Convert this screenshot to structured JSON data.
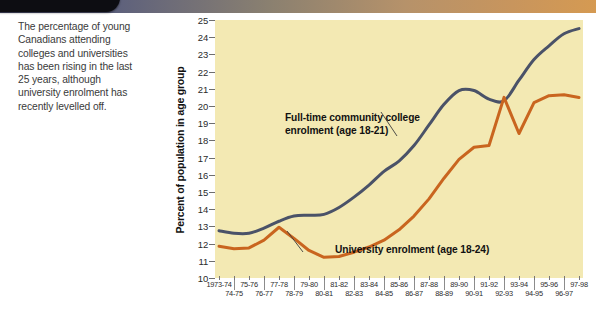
{
  "caption": {
    "text": "The percentage of young Canadians attending colleges and universities has been rising in the last 25 years, although university enrolment has recently levelled off."
  },
  "chart_data": {
    "type": "line",
    "title": "",
    "xlabel": "",
    "ylabel": "Percent of population in age group",
    "ylim": [
      10,
      25
    ],
    "yticks": [
      10,
      11,
      12,
      13,
      14,
      15,
      16,
      17,
      18,
      19,
      20,
      21,
      22,
      23,
      24,
      25
    ],
    "grid": false,
    "legend_position": "inline-annotation",
    "categories": [
      "1973-74",
      "74-75",
      "75-76",
      "76-77",
      "77-78",
      "78-79",
      "79-80",
      "80-81",
      "81-82",
      "82-83",
      "83-84",
      "84-85",
      "85-86",
      "86-87",
      "87-88",
      "88-89",
      "89-90",
      "90-91",
      "91-92",
      "92-93",
      "93-94",
      "94-95",
      "95-96",
      "96-97",
      "97-98"
    ],
    "xtick_labels_top": [
      "1973-74",
      "75-76",
      "77-78",
      "79-80",
      "81-82",
      "83-84",
      "85-86",
      "87-88",
      "89-90",
      "91-92",
      "93-94",
      "95-96",
      "97-98"
    ],
    "xtick_labels_bottom": [
      "74-75",
      "76-77",
      "78-79",
      "80-81",
      "82-83",
      "84-85",
      "86-87",
      "88-89",
      "90-91",
      "92-93",
      "94-95",
      "96-97"
    ],
    "series": [
      {
        "name": "Full-time community college enrolment (age 18-21)",
        "color": "#4a5268",
        "values": [
          12.75,
          12.6,
          12.6,
          12.9,
          13.3,
          13.6,
          13.65,
          13.7,
          14.1,
          14.7,
          15.4,
          16.2,
          16.8,
          17.7,
          18.9,
          20.1,
          20.9,
          20.9,
          20.4,
          20.3,
          21.5,
          22.7,
          23.5,
          24.2,
          24.5
        ]
      },
      {
        "name": "University enrolment (age 18-24)",
        "color": "#c9651f",
        "values": [
          11.85,
          11.7,
          11.75,
          12.2,
          12.95,
          12.3,
          11.6,
          11.2,
          11.25,
          11.5,
          11.8,
          12.2,
          12.8,
          13.6,
          14.6,
          15.8,
          16.9,
          17.6,
          17.7,
          20.5,
          18.4,
          20.2,
          20.6,
          20.65,
          20.5
        ]
      }
    ],
    "annotations": [
      {
        "id": "annot-college",
        "line1": "Full-time community college",
        "line2": "enrolment (age 18-21)"
      },
      {
        "id": "annot-university",
        "line1": "University enrolment (age 18-24)",
        "line2": ""
      }
    ],
    "colors": {
      "plot_background": "#f3e9b3",
      "college_line": "#4a5268",
      "university_line": "#c9651f"
    }
  }
}
